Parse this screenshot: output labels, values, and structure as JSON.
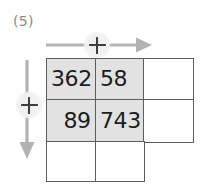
{
  "problem": {
    "label": "(5)"
  },
  "annotations": {
    "horizontal": {
      "operator": "+",
      "icon": "plus-in-circle",
      "arrow_icon": "arrow-right-icon",
      "direction": "right"
    },
    "vertical": {
      "operator": "+",
      "icon": "plus-in-circle",
      "arrow_icon": "arrow-down-icon",
      "direction": "down"
    }
  },
  "grid": {
    "columns": 3,
    "rows": 3,
    "shaded_color": "#e2e2e2",
    "border_color": "#5d5d5d",
    "cells": [
      [
        {
          "value": "362",
          "shaded": true,
          "align": "left",
          "present": true
        },
        {
          "value": "58",
          "shaded": true,
          "align": "left",
          "present": true
        },
        {
          "value": "",
          "shaded": false,
          "align": "left",
          "present": true
        }
      ],
      [
        {
          "value": "89",
          "shaded": true,
          "align": "right",
          "present": true
        },
        {
          "value": "743",
          "shaded": true,
          "align": "left",
          "present": true
        },
        {
          "value": "",
          "shaded": false,
          "align": "left",
          "present": true
        }
      ],
      [
        {
          "value": "",
          "shaded": false,
          "align": "left",
          "present": true
        },
        {
          "value": "",
          "shaded": false,
          "align": "left",
          "present": true
        },
        {
          "value": "",
          "shaded": false,
          "align": "left",
          "present": false
        }
      ]
    ]
  }
}
